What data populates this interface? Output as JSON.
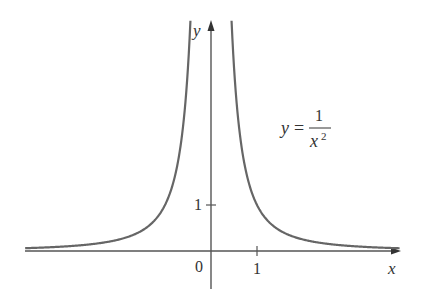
{
  "chart_data": {
    "type": "line",
    "title": "",
    "function": "y = 1/x^2",
    "annotation": {
      "lhs": "y",
      "equals": "=",
      "numerator": "1",
      "denominator_base": "x",
      "denominator_exp": "2"
    },
    "xlabel": "x",
    "ylabel": "y",
    "origin_label": "0",
    "x_ticks": [
      {
        "value": 1,
        "label": "1"
      }
    ],
    "y_ticks": [
      {
        "value": 1,
        "label": "1"
      }
    ],
    "xlim": [
      -4.04,
      4.1
    ],
    "ylim": [
      -0.8,
      5.0
    ],
    "grid": false,
    "legend": null,
    "series": [
      {
        "name": "y = 1/x^2 (x<0)",
        "x": [
          -4.04,
          -3.5,
          -3,
          -2.5,
          -2,
          -1.5,
          -1.25,
          -1,
          -0.8,
          -0.7,
          -0.6,
          -0.5,
          -0.447
        ],
        "y": [
          0.061,
          0.082,
          0.111,
          0.16,
          0.25,
          0.444,
          0.64,
          1.0,
          1.5625,
          2.04,
          2.78,
          4.0,
          5.0
        ]
      },
      {
        "name": "y = 1/x^2 (x>0)",
        "x": [
          0.447,
          0.5,
          0.6,
          0.7,
          0.8,
          1,
          1.25,
          1.5,
          2,
          2.5,
          3,
          3.5,
          4.1
        ],
        "y": [
          5.0,
          4.0,
          2.78,
          2.04,
          1.5625,
          1.0,
          0.64,
          0.444,
          0.25,
          0.16,
          0.111,
          0.082,
          0.059
        ]
      }
    ],
    "colors": {
      "curve": "#666666",
      "axes": "#555555",
      "text": "#333333"
    }
  }
}
